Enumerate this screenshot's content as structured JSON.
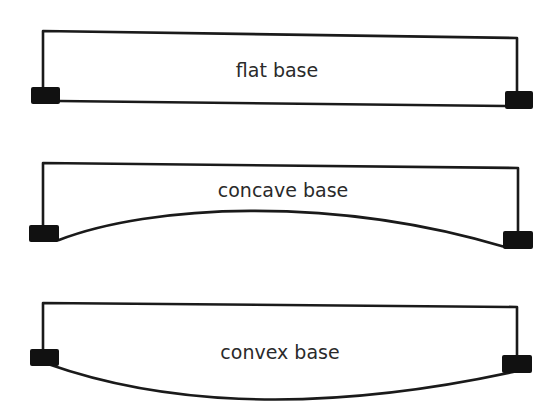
{
  "diagram": {
    "title": "",
    "panels": [
      {
        "id": "flat",
        "label": "flat base",
        "base_shape": "flat"
      },
      {
        "id": "concave",
        "label": "concave base",
        "base_shape": "concave"
      },
      {
        "id": "convex",
        "label": "convex base",
        "base_shape": "convex"
      }
    ],
    "colors": {
      "stroke": "#1a1a1a",
      "pad_fill": "#111111",
      "text": "#2a2a2a",
      "background": "#ffffff"
    }
  }
}
